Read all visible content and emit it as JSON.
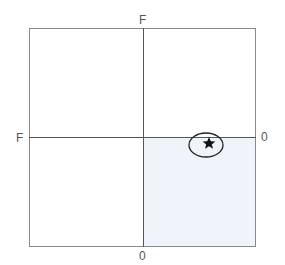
{
  "diagram": {
    "box": {
      "x": 29,
      "y": 28,
      "width": 227,
      "height": 219
    },
    "center": {
      "x": 143,
      "y": 137
    },
    "colors": {
      "border": "#8a8a8a",
      "axis": "#555555",
      "shaded_quadrant": "#eef4f9",
      "ellipse_stroke": "#222222",
      "star_fill": "#111111"
    },
    "shaded_quadrant": "bottom-right",
    "labels": {
      "top": "F",
      "left": "F",
      "right": "0",
      "bottom": "0"
    },
    "marker": {
      "ellipse": {
        "cx": 206,
        "cy": 145,
        "rx": 17,
        "ry": 12
      },
      "star": {
        "cx": 209,
        "cy": 143,
        "size": 12
      },
      "icon": "star-icon"
    }
  }
}
